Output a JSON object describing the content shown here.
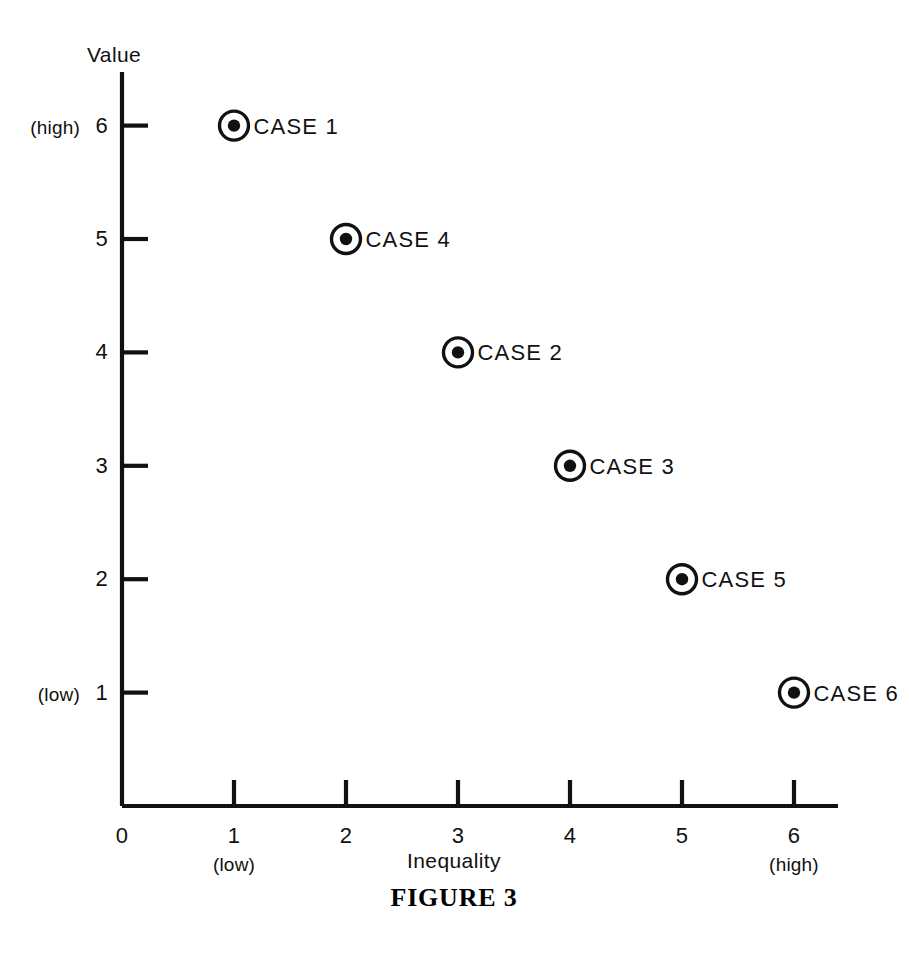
{
  "figure": {
    "caption": "FIGURE 3"
  },
  "chart_data": {
    "type": "scatter",
    "title": "",
    "xlabel": "Inequality",
    "ylabel": "Value",
    "xlim": [
      0,
      6.4
    ],
    "ylim": [
      0,
      6.5
    ],
    "grid": false,
    "legend": "none",
    "x_ticks": [
      0,
      1,
      2,
      3,
      4,
      5,
      6
    ],
    "x_tick_labels": [
      "0",
      "1",
      "2",
      "3",
      "4",
      "5",
      "6"
    ],
    "x_tick_qualifiers": {
      "1": "(low)",
      "6": "(high)"
    },
    "y_ticks": [
      1,
      2,
      3,
      4,
      5,
      6
    ],
    "y_tick_labels": [
      "1",
      "2",
      "3",
      "4",
      "5",
      "6"
    ],
    "y_tick_qualifiers": {
      "1": "(low)",
      "6": "(high)"
    },
    "marker_style": "bullseye",
    "points": [
      {
        "label": "CASE 1",
        "x": 1,
        "y": 6
      },
      {
        "label": "CASE 4",
        "x": 2,
        "y": 5
      },
      {
        "label": "CASE 2",
        "x": 3,
        "y": 4
      },
      {
        "label": "CASE 3",
        "x": 4,
        "y": 3
      },
      {
        "label": "CASE 5",
        "x": 5,
        "y": 2
      },
      {
        "label": "CASE 6",
        "x": 6,
        "y": 1
      }
    ],
    "colors": {
      "ink": "#111111",
      "background": "#ffffff",
      "marker_fill": "#111111"
    }
  },
  "axis_labels": {
    "x_title": "Inequality",
    "y_title": "Value",
    "origin": "0"
  }
}
